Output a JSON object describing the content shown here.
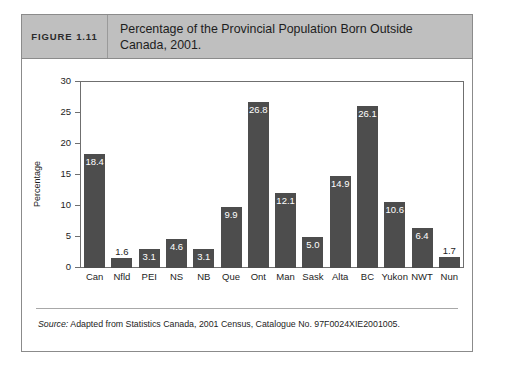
{
  "figure": {
    "number_label": "FIGURE 1.11",
    "title": "Percentage of the Provincial Population Born Outside Canada, 2001.",
    "source_prefix": "Source:",
    "source_text": " Adapted from Statistics Canada, 2001 Census, Catalogue No. 97F0024XIE2001005."
  },
  "colors": {
    "bar": "#4d4d4d",
    "header_background": "#bfbfbf",
    "frame_border": "#8b8b8b",
    "axis": "#6f6f6f",
    "inside_label_text": "#ffffff",
    "outside_label_text": "#1d1d1d"
  },
  "chart_data": {
    "type": "bar",
    "title": "Percentage of the Provincial Population Born Outside Canada, 2001.",
    "xlabel": "",
    "ylabel": "Percentage",
    "ylim": [
      0,
      30
    ],
    "yticks": [
      0,
      5,
      10,
      15,
      20,
      25,
      30
    ],
    "ytick_labels": [
      "0",
      "5",
      "10",
      "15",
      "20",
      "25",
      "30"
    ],
    "grid": false,
    "legend": "none",
    "categories": [
      "Can",
      "Nfld",
      "PEI",
      "NS",
      "NB",
      "Que",
      "Ont",
      "Man",
      "Sask",
      "Alta",
      "BC",
      "Yukon",
      "NWT",
      "Nun"
    ],
    "values": [
      18.4,
      1.6,
      3.1,
      4.6,
      3.1,
      9.9,
      26.8,
      12.1,
      5.0,
      14.9,
      26.1,
      10.6,
      6.4,
      1.7
    ],
    "value_labels": [
      "18.4",
      "1.6",
      "3.1",
      "4.6",
      "3.1",
      "9.9",
      "26.8",
      "12.1",
      "5.0",
      "14.9",
      "26.1",
      "10.6",
      "6.4",
      "1.7"
    ],
    "label_placement": [
      "inside",
      "outside",
      "inside",
      "inside",
      "inside",
      "inside",
      "inside",
      "inside",
      "inside",
      "inside",
      "inside",
      "inside",
      "inside",
      "outside"
    ]
  }
}
